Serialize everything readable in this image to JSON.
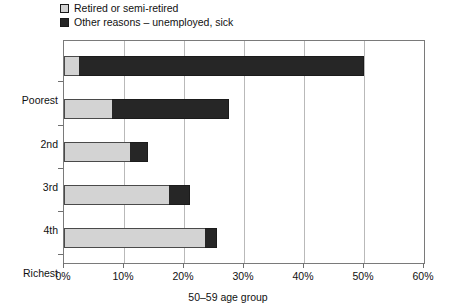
{
  "chart_data": {
    "type": "bar",
    "orientation": "horizontal",
    "stacked": true,
    "title": "",
    "xlabel": "50–59 age group",
    "ylabel": "",
    "xlim": [
      0,
      60
    ],
    "xtick_labels": [
      "0%",
      "10%",
      "20%",
      "30%",
      "40%",
      "50%",
      "60%"
    ],
    "xtick_values": [
      0,
      10,
      20,
      30,
      40,
      50,
      60
    ],
    "grid": true,
    "grid_axis": "x",
    "legend_position": "top-left",
    "categories": [
      "Poorest",
      "2nd",
      "3rd",
      "4th",
      "Richest"
    ],
    "series": [
      {
        "name": "Retired or semi-retired",
        "color": "#d3d3d3",
        "values": [
          2.5,
          8.0,
          11.0,
          17.5,
          23.5
        ]
      },
      {
        "name": "Other reasons – unemployed, sick",
        "color": "#262626",
        "values": [
          47.5,
          19.5,
          3.0,
          3.5,
          2.0
        ]
      }
    ],
    "totals": [
      50.0,
      27.5,
      14.0,
      21.0,
      25.5
    ]
  },
  "legend": {
    "items": [
      {
        "label": "Retired or semi-retired",
        "swatch": "light-gray-swatch"
      },
      {
        "label": "Other reasons – unemployed, sick",
        "swatch": "dark-swatch"
      }
    ]
  },
  "axes": {
    "x_title": "50–59 age group",
    "x_ticks": [
      "0%",
      "10%",
      "20%",
      "30%",
      "40%",
      "50%",
      "60%"
    ],
    "y_ticks": [
      "Poorest",
      "2nd",
      "3rd",
      "4th",
      "Richest"
    ]
  },
  "colors": {
    "retired": "#d3d3d3",
    "other": "#262626",
    "frame": "#7a7a7a",
    "grid": "#b9b9b9",
    "text": "#111111"
  }
}
